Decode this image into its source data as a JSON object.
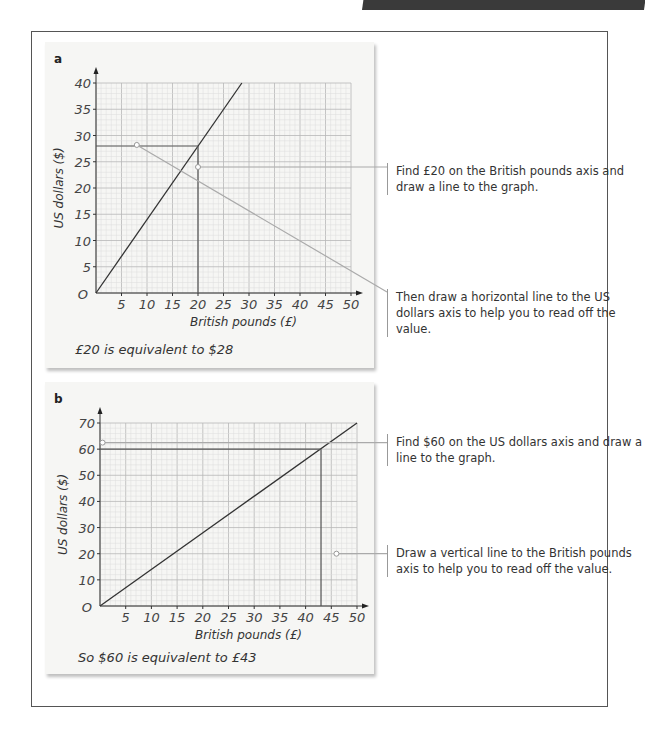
{
  "header": {
    "bar": "dark-tab"
  },
  "panels": [
    {
      "label": "a",
      "conclusion": "£20 is equivalent to $28"
    },
    {
      "label": "b",
      "conclusion": "So $60 is equivalent to £43"
    }
  ],
  "callouts": [
    {
      "text": "Find £20 on the British pounds axis and draw a line to the graph."
    },
    {
      "text": "Then draw a horizontal line to the US dollars axis to help you to read off the value."
    },
    {
      "text": "Find $60 on the US dollars axis and draw a line to the graph."
    },
    {
      "text": "Draw a vertical line to the British pounds axis to help you to read off the value."
    }
  ],
  "chart_data": [
    {
      "type": "line",
      "title": "a",
      "xlabel": "British pounds (£)",
      "ylabel": "US dollars ($)",
      "xlim": [
        0,
        50
      ],
      "ylim": [
        0,
        40
      ],
      "xticks": [
        5,
        10,
        15,
        20,
        25,
        30,
        35,
        40,
        45,
        50
      ],
      "yticks": [
        5,
        10,
        15,
        20,
        25,
        30,
        35,
        40
      ],
      "origin_label": "O",
      "grid": true,
      "series": [
        {
          "name": "conversion",
          "x": [
            0,
            28.6
          ],
          "y": [
            0,
            40
          ]
        }
      ],
      "annotations": [
        {
          "type": "vline",
          "x": 20,
          "y_to": 28
        },
        {
          "type": "hline",
          "y": 28,
          "x_to": 20
        }
      ],
      "result": "£20 = $28"
    },
    {
      "type": "line",
      "title": "b",
      "xlabel": "British pounds (£)",
      "ylabel": "US dollars ($)",
      "xlim": [
        0,
        50
      ],
      "ylim": [
        0,
        70
      ],
      "xticks": [
        5,
        10,
        15,
        20,
        25,
        30,
        35,
        40,
        45,
        50
      ],
      "yticks": [
        10,
        20,
        30,
        40,
        50,
        60,
        70
      ],
      "origin_label": "O",
      "grid": true,
      "series": [
        {
          "name": "conversion",
          "x": [
            0,
            50
          ],
          "y": [
            0,
            70
          ]
        }
      ],
      "annotations": [
        {
          "type": "hline",
          "y": 60,
          "x_to": 43
        },
        {
          "type": "vline",
          "x": 43,
          "y_to": 60
        }
      ],
      "result": "$60 = £43"
    }
  ]
}
